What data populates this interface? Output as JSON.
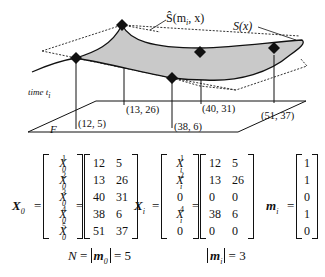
{
  "diagram": {
    "labels": {
      "s_hat": "Ŝ(m",
      "s_hat_sub": "i",
      "s_hat_tail": ", x)",
      "s": "S(x)",
      "time": "time t",
      "time_sub": "i",
      "floor": "F"
    },
    "points": [
      {
        "label": "(12, 5)",
        "coord": [
          12,
          5
        ]
      },
      {
        "label": "(13, 26)",
        "coord": [
          13,
          26
        ]
      },
      {
        "label": "(40, 31)",
        "coord": [
          40,
          31
        ]
      },
      {
        "label": "(38, 6)",
        "coord": [
          38,
          6
        ]
      },
      {
        "label": "(51, 37)",
        "coord": [
          51,
          37
        ]
      }
    ]
  },
  "equations": {
    "x0": {
      "name": "X",
      "name_sub": "0",
      "symbols": [
        {
          "base": "X",
          "sup": "1",
          "sub": "0"
        },
        {
          "base": "X",
          "sup": "2",
          "sub": "0"
        },
        {
          "base": "X",
          "sup": "3",
          "sub": "0"
        },
        {
          "base": "X",
          "sup": "4",
          "sub": "0"
        },
        {
          "base": "X",
          "sup": "5",
          "sub": "0"
        }
      ],
      "values": [
        [
          "12",
          "5"
        ],
        [
          "13",
          "26"
        ],
        [
          "40",
          "31"
        ],
        [
          "38",
          "6"
        ],
        [
          "51",
          "37"
        ]
      ]
    },
    "xi": {
      "name": "X",
      "name_sub": "i",
      "symbols": [
        {
          "base": "X",
          "sup": "1",
          "sub": "i"
        },
        {
          "base": "X",
          "sup": "2",
          "sub": "i"
        },
        {
          "base": "0",
          "sup": "",
          "sub": ""
        },
        {
          "base": "X",
          "sup": "4",
          "sub": "i"
        },
        {
          "base": "0",
          "sup": "",
          "sub": ""
        }
      ],
      "values": [
        [
          "12",
          "5"
        ],
        [
          "13",
          "26"
        ],
        [
          "0",
          "0"
        ],
        [
          "38",
          "6"
        ],
        [
          "0",
          "0"
        ]
      ]
    },
    "mi": {
      "name": "m",
      "name_sub": "i",
      "values": [
        "1",
        "1",
        "0",
        "1",
        "0"
      ]
    },
    "eq_sign": "=",
    "n_eq": {
      "lhs": "N",
      "eq1": " = ",
      "abs_var": "m",
      "abs_sub": "0",
      "rhs": " = 5"
    },
    "mi_count": {
      "abs_var": "m",
      "abs_sub": "i",
      "rhs": " = 3"
    }
  }
}
